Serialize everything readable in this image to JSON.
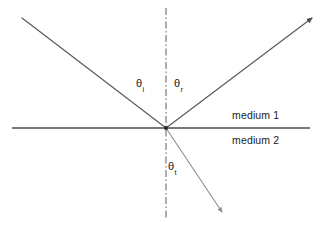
{
  "figure": {
    "background_color": "#ffffff"
  },
  "labels": {
    "theta_incident": {
      "symbol": "θ",
      "subscript": "i"
    },
    "theta_reflected": {
      "symbol": "θ",
      "subscript": "r"
    },
    "theta_transmitted": {
      "symbol": "θ",
      "subscript": "t"
    },
    "medium_1": "medium 1",
    "medium_2": "medium 2"
  },
  "geometry": {
    "origin": {
      "x": 166,
      "y": 128
    },
    "interface_line": {
      "x1": 12,
      "y1": 128,
      "x2": 310,
      "y2": 128,
      "color": "#4d4d4d",
      "width": 1.3
    },
    "normal_line": {
      "x1": 166,
      "y1": 8,
      "x2": 166,
      "y2": 218,
      "color": "#6b6b6b",
      "width": 1.1,
      "dash": "7,2.5,1.5,2.5"
    },
    "incident_ray": {
      "x1": 22,
      "y1": 18,
      "x2": 166,
      "y2": 128,
      "color": "#5a5a5a",
      "width": 1.2,
      "arrow": false
    },
    "reflected_ray": {
      "x1": 166,
      "y1": 128,
      "x2": 312,
      "y2": 18,
      "color": "#5a5a5a",
      "width": 1.2,
      "arrow": true
    },
    "refracted_ray": {
      "x1": 166,
      "y1": 128,
      "x2": 222,
      "y2": 212,
      "color": "#8f8f8f",
      "width": 1.1,
      "arrow": true
    }
  },
  "colors": {
    "ray": "#5a5a5a",
    "refracted_ray": "#8f8f8f",
    "interface": "#4d4d4d",
    "normal": "#6b6b6b",
    "text": "#1a1a1a"
  }
}
